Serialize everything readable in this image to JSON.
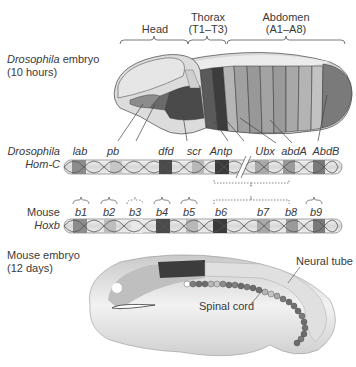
{
  "drosophila_embryo": {
    "name_italic": "Drosophila",
    "name_rest": " embryo",
    "age": "(10 hours)",
    "regions": [
      {
        "label": "Head",
        "sub": ""
      },
      {
        "label": "Thorax",
        "sub": "(T1–T3)"
      },
      {
        "label": "Abdomen",
        "sub": "(A1–A8)"
      }
    ]
  },
  "hom_c": {
    "label_line1": "Drosophila",
    "label_line2": "Hom-C",
    "genes": [
      "lab",
      "pb",
      "dfd",
      "scr",
      "Antp",
      "Ubx",
      "abdA",
      "AbdB"
    ]
  },
  "hoxb": {
    "label_line1": "Mouse",
    "label_line2": "Hoxb",
    "genes": [
      "b1",
      "b2",
      "b3",
      "b4",
      "b5",
      "b6",
      "b7",
      "b8",
      "b9"
    ]
  },
  "mouse_embryo": {
    "name": "Mouse embryo",
    "age": "(12 days)",
    "annotations": [
      "Neural tube",
      "Spinal cord"
    ]
  },
  "colors": {
    "lab": "#8c8c8c",
    "pb": "#c4c4c4",
    "dfd": "#4a4a4a",
    "scr": "#b8b8b8",
    "Antp": "#3a3a3a",
    "Ubx": "#a8a8a8",
    "abdA": "#9a9a9a",
    "AbdB": "#7a7a7a",
    "body_light": "#dcdcdc",
    "outline": "#555555"
  }
}
